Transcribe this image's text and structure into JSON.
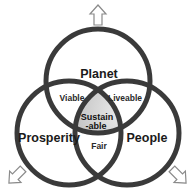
{
  "diagram": {
    "type": "venn",
    "sets": [
      {
        "id": "planet",
        "label": "Planet"
      },
      {
        "id": "prosperity",
        "label": "Prosperity"
      },
      {
        "id": "people",
        "label": "People"
      }
    ],
    "intersections": {
      "planet_prosperity": "Viable",
      "planet_people": "Liveable",
      "prosperity_people": "Fair",
      "center_line1": "Sustain",
      "center_line2": "-able"
    },
    "arrows": [
      {
        "direction": "up",
        "name": "arrow-up-icon"
      },
      {
        "direction": "down-left",
        "name": "arrow-down-left-icon"
      },
      {
        "direction": "down-right",
        "name": "arrow-down-right-icon"
      }
    ],
    "colors": {
      "stroke": "#3a3a3a",
      "center_fill_light": "#e6e6e6",
      "center_fill_dark": "#a9a9a9",
      "arrow_stroke": "#8a8a8a",
      "background": "#ffffff"
    }
  }
}
